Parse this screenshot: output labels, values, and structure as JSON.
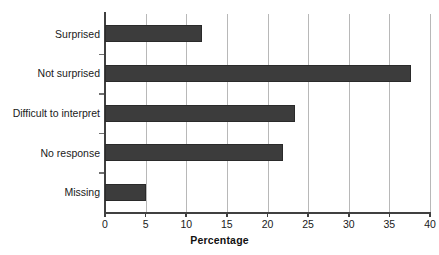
{
  "chart_data": {
    "type": "bar",
    "orientation": "horizontal",
    "title": "",
    "xlabel": "Percentage",
    "ylabel": "",
    "categories": [
      "Surprised",
      "Not surprised",
      "Difficult to interpret",
      "No response",
      "Missing"
    ],
    "values": [
      11.9,
      37.6,
      23.4,
      21.9,
      5.0
    ],
    "xlim": [
      0,
      40
    ],
    "xticks": [
      0,
      5,
      10,
      15,
      20,
      25,
      30,
      35,
      40
    ],
    "xtick_labels": [
      "0",
      "5",
      "10",
      "15",
      "20",
      "25",
      "30",
      "35",
      "40"
    ],
    "grid": "vertical",
    "legend": "none",
    "bar_color": "#3c3c3c",
    "gridline_color": "#b8b8b8",
    "axis_color": "#404040"
  }
}
